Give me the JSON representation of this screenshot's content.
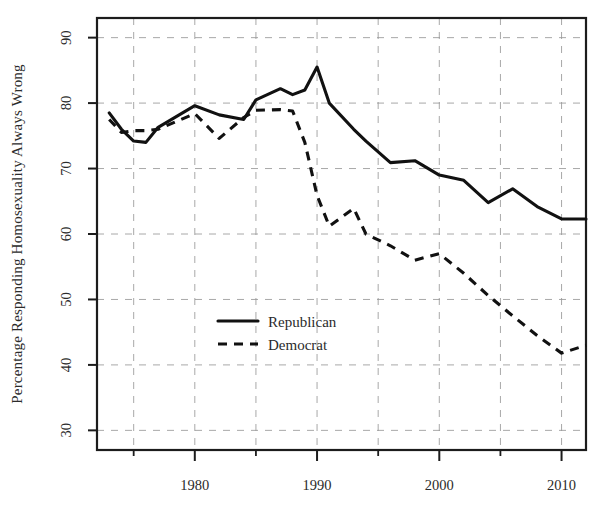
{
  "chart_data": {
    "type": "line",
    "title": "",
    "xlabel": "",
    "ylabel": "Percentage Responding Homosexuality Always Wrong",
    "xlim": [
      1972,
      2012
    ],
    "ylim": [
      27,
      93
    ],
    "grid": true,
    "legend_position": "center-left",
    "xticks": [
      1980,
      1990,
      2000,
      2010
    ],
    "xtick_labels": [
      "1980",
      "1990",
      "2000",
      "2010"
    ],
    "xticks_minor": [
      1975,
      1985,
      1995,
      2005
    ],
    "yticks": [
      30,
      40,
      50,
      60,
      70,
      80,
      90
    ],
    "ytick_labels": [
      "30",
      "40",
      "50",
      "60",
      "70",
      "80",
      "90"
    ],
    "series": [
      {
        "name": "Republican",
        "style": "solid",
        "color": "#111111",
        "x": [
          1973,
          1974,
          1975,
          1976,
          1977,
          1980,
          1982,
          1984,
          1985,
          1987,
          1988,
          1989,
          1990,
          1991,
          1993,
          1994,
          1996,
          1998,
          2000,
          2002,
          2004,
          2006,
          2008,
          2010,
          2012
        ],
        "values": [
          78.5,
          76.0,
          74.2,
          74.0,
          76.3,
          79.6,
          78.2,
          77.5,
          80.5,
          82.2,
          81.3,
          82.0,
          85.5,
          80.0,
          76.0,
          74.2,
          70.9,
          71.2,
          69.0,
          68.2,
          64.8,
          66.9,
          64.2,
          62.3,
          62.3
        ]
      },
      {
        "name": "Democrat",
        "style": "dashed",
        "color": "#111111",
        "x": [
          1973,
          1974,
          1975,
          1976,
          1977,
          1980,
          1982,
          1984,
          1985,
          1987,
          1988,
          1989,
          1990,
          1991,
          1993,
          1994,
          1996,
          1998,
          2000,
          2002,
          2004,
          2006,
          2008,
          2010,
          2012
        ],
        "values": [
          77.5,
          75.5,
          75.8,
          75.8,
          76.0,
          78.4,
          74.6,
          77.8,
          78.9,
          79.0,
          78.8,
          74.0,
          65.9,
          61.2,
          63.9,
          60.0,
          58.2,
          56.0,
          57.0,
          54.0,
          50.6,
          47.5,
          44.5,
          41.8,
          43.0
        ]
      }
    ]
  },
  "legend": {
    "entries": [
      {
        "label": "Republican",
        "style": "solid"
      },
      {
        "label": "Democrat",
        "style": "dashed"
      }
    ]
  }
}
